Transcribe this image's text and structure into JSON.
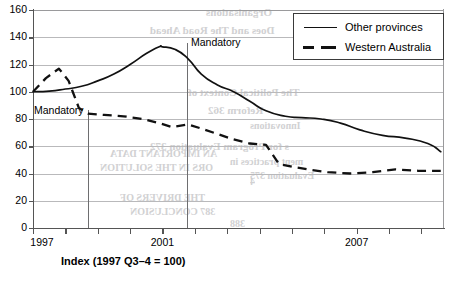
{
  "figure": {
    "x_caption": "Index (1997 Q3–4 = 100)",
    "annotation_label_1": "Mandatory",
    "annotation_label_2": "Mandatory"
  },
  "legend": {
    "items": [
      {
        "label": "Other provinces",
        "style": "solid",
        "color": "#111111"
      },
      {
        "label": "Western Australia",
        "style": "dashed",
        "color": "#111111"
      }
    ]
  },
  "axes": {
    "y_ticks": [
      "0",
      "20",
      "40",
      "60",
      "80",
      "100",
      "120",
      "140",
      "160"
    ],
    "x_ticks": [
      "1997",
      "2001",
      "2007"
    ]
  },
  "bleed_text": [
    {
      "text": "Organisations",
      "x": 206,
      "y": 6,
      "size": 11
    },
    {
      "text": "Does and The Road Ahead",
      "x": 150,
      "y": 24,
      "size": 11
    },
    {
      "text": "351",
      "x": 300,
      "y": 44,
      "size": 11
    },
    {
      "text": "The Political Context of",
      "x": 188,
      "y": 86,
      "size": 11
    },
    {
      "text": "Reform    362",
      "x": 208,
      "y": 104,
      "size": 11
    },
    {
      "text": "Innovations",
      "x": 250,
      "y": 120,
      "size": 10
    },
    {
      "text": "s for Program Evaluation    372",
      "x": 150,
      "y": 140,
      "size": 11
    },
    {
      "text": "ment practices in",
      "x": 230,
      "y": 156,
      "size": 10
    },
    {
      "text": "Evaluation    375",
      "x": 250,
      "y": 170,
      "size": 10
    },
    {
      "text": "AN IMPORTANT DATA",
      "x": 110,
      "y": 148,
      "size": 10
    },
    {
      "text": "ORS IN THE SOLUTION",
      "x": 100,
      "y": 162,
      "size": 10
    },
    {
      "text": "4",
      "x": 250,
      "y": 176,
      "size": 10
    },
    {
      "text": "THE DRIVERS OF",
      "x": 120,
      "y": 192,
      "size": 10
    },
    {
      "text": "387    CONCLUSION",
      "x": 130,
      "y": 206,
      "size": 10
    },
    {
      "text": "388",
      "x": 230,
      "y": 218,
      "size": 10
    }
  ],
  "chart_data": {
    "type": "line",
    "title": "",
    "xlabel": "Index (1997 Q3–4 = 100)",
    "ylabel": "",
    "ylim": [
      0,
      160
    ],
    "xlim": [
      1997,
      2009.7
    ],
    "grid": true,
    "legend_position": "top-right",
    "x_tick_labels": [
      "1997",
      "2001",
      "2007"
    ],
    "y_tick_values": [
      0,
      20,
      40,
      60,
      80,
      100,
      120,
      140,
      160
    ],
    "annotations": [
      {
        "text": "Mandatory",
        "x": 1998.42,
        "series": "Western Australia",
        "line": true
      },
      {
        "text": "Mandatory",
        "x": 2001.0,
        "series": "Other provinces",
        "line": true
      }
    ],
    "series": [
      {
        "name": "Other provinces",
        "style": "solid",
        "x": [
          1997.0,
          1997.5,
          1998.0,
          1998.5,
          1999.0,
          1999.5,
          2000.0,
          2000.5,
          2000.9,
          2001.0,
          2001.4,
          2001.8,
          2002.2,
          2002.7,
          2003.2,
          2003.7,
          2004.2,
          2004.8,
          2005.3,
          2005.9,
          2006.5,
          2007.1,
          2007.8,
          2008.5,
          2009.2,
          2009.6
        ],
        "y": [
          100,
          100.5,
          102,
          104,
          108,
          113,
          120,
          128,
          133,
          133,
          131,
          124,
          113,
          105,
          100,
          93,
          86,
          82,
          81,
          80,
          77,
          72,
          68,
          66,
          62,
          56
        ]
      },
      {
        "name": "Western Australia",
        "style": "dashed",
        "x": [
          1997.0,
          1997.4,
          1997.8,
          1998.1,
          1998.42,
          1998.7,
          1999.2,
          1999.8,
          2000.4,
          2000.9,
          2001.3,
          2001.8,
          2002.2,
          2002.7,
          2003.2,
          2003.7,
          2004.2,
          2004.6,
          2005.0,
          2005.5,
          2006.1,
          2006.8,
          2007.5,
          2008.2,
          2008.9,
          2009.6
        ],
        "y": [
          100,
          110,
          117,
          108,
          88,
          84,
          83,
          82,
          80,
          77,
          74,
          76,
          73,
          69,
          65,
          62,
          61,
          47,
          45,
          43,
          41,
          40,
          41,
          43,
          42,
          42
        ]
      }
    ]
  }
}
